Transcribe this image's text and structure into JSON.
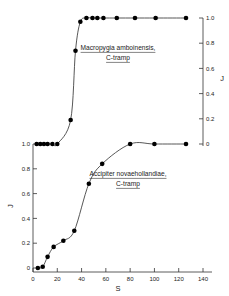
{
  "figure": {
    "xlabel": "S",
    "left_ylabel": "J",
    "right_ylabel": "J"
  },
  "axes": {
    "x_ticks": [
      "0",
      "20",
      "40",
      "60",
      "80",
      "100",
      "120",
      "140"
    ],
    "x_tick_values": [
      0,
      20,
      40,
      60,
      80,
      100,
      120,
      140
    ],
    "y_ticks": [
      "0",
      "0.2",
      "0.4",
      "0.6",
      "0.8",
      "1.0"
    ],
    "y_tick_values": [
      0,
      0.2,
      0.4,
      0.6,
      0.8,
      1.0
    ]
  },
  "annotations": {
    "upper": {
      "line1": "Macropygia amboinensis,",
      "line2": "C-tramp"
    },
    "lower": {
      "line1": "Accipiter novaehollandiae,",
      "line2": "C-tramp"
    }
  },
  "chart_data": {
    "type": "scatter",
    "title": "",
    "xlabel": "S",
    "ylabel": "J",
    "xlim": [
      0,
      140
    ],
    "ylim": [
      0,
      1.0
    ],
    "grid": false,
    "legend": "inline-annotation",
    "series": [
      {
        "name": "Macropygia amboinensis, C-tramp",
        "axis": "right",
        "marker": "filled-circle",
        "x": [
          3,
          6,
          9,
          12,
          16,
          20,
          31,
          35,
          39,
          44,
          49,
          53,
          58,
          69,
          84,
          101,
          126
        ],
        "y": [
          0.0,
          0.0,
          0.0,
          0.0,
          0.0,
          0.0,
          0.19,
          0.74,
          0.97,
          1.0,
          1.0,
          1.0,
          1.0,
          1.0,
          1.0,
          1.0,
          1.0
        ]
      },
      {
        "name": "Accipiter novaehollandiae, C-tramp",
        "axis": "left",
        "marker": "filled-circle",
        "x": [
          4,
          8,
          12,
          17,
          25,
          34,
          46,
          57,
          80,
          100,
          126
        ],
        "y": [
          0.0,
          0.01,
          0.09,
          0.17,
          0.22,
          0.3,
          0.68,
          0.84,
          1.0,
          1.0,
          1.0
        ]
      }
    ]
  }
}
